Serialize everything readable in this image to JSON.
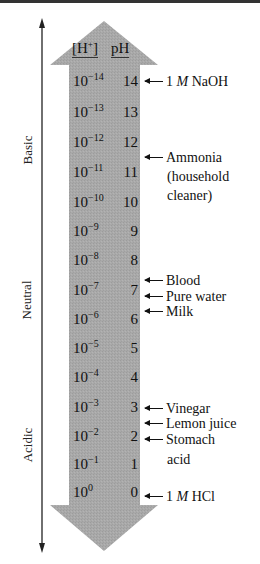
{
  "figure": {
    "headers": {
      "h_concentration": "[H",
      "h_plus": "+",
      "h_close": "]",
      "ph": "pH"
    },
    "side_labels": {
      "basic": "Basic",
      "neutral": "Neutral",
      "acidic": "Acidic"
    },
    "rows": [
      {
        "h_base": "10",
        "h_exp": "-14",
        "ph": "14"
      },
      {
        "h_base": "10",
        "h_exp": "-13",
        "ph": "13"
      },
      {
        "h_base": "10",
        "h_exp": "-12",
        "ph": "12"
      },
      {
        "h_base": "10",
        "h_exp": "-11",
        "ph": "11"
      },
      {
        "h_base": "10",
        "h_exp": "-10",
        "ph": "10"
      },
      {
        "h_base": "10",
        "h_exp": "-9",
        "ph": "9"
      },
      {
        "h_base": "10",
        "h_exp": "-8",
        "ph": "8"
      },
      {
        "h_base": "10",
        "h_exp": "-7",
        "ph": "7"
      },
      {
        "h_base": "10",
        "h_exp": "-6",
        "ph": "6"
      },
      {
        "h_base": "10",
        "h_exp": "-5",
        "ph": "5"
      },
      {
        "h_base": "10",
        "h_exp": "-4",
        "ph": "4"
      },
      {
        "h_base": "10",
        "h_exp": "-3",
        "ph": "3"
      },
      {
        "h_base": "10",
        "h_exp": "-2",
        "ph": "2"
      },
      {
        "h_base": "10",
        "h_exp": "-1",
        "ph": "1"
      },
      {
        "h_base": "10",
        "h_exp": "0",
        "ph": "0"
      }
    ],
    "annotations": {
      "naoh": {
        "pre": "1 ",
        "italic": "M",
        "post": " NaOH"
      },
      "ammonia": {
        "line1": "Ammonia",
        "line2": "(household",
        "line3": "cleaner)"
      },
      "blood": "Blood",
      "pure_water": "Pure water",
      "milk": "Milk",
      "vinegar": "Vinegar",
      "lemon_juice": "Lemon juice",
      "stomach_acid": {
        "line1": "Stomach",
        "line2": "acid"
      },
      "hcl": {
        "pre": "1 ",
        "italic": "M",
        "post": " HCl"
      }
    },
    "colors": {
      "arrow_fill": "#a8a8a8",
      "text": "#111111",
      "line": "#222222"
    }
  }
}
